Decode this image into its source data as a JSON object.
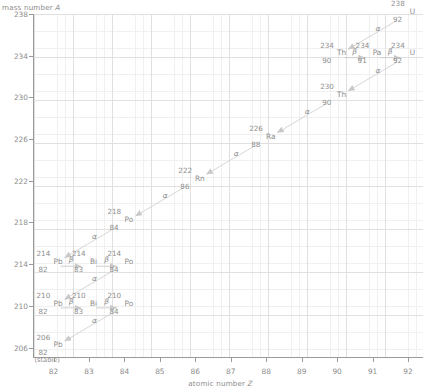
{
  "axes": {
    "y_title_text": "mass number ",
    "y_title_var": "A",
    "x_title_text": "atomic number ",
    "x_title_var": "Z",
    "y_ticks": [
      238,
      234,
      230,
      226,
      222,
      218,
      214,
      210,
      206
    ],
    "x_ticks": [
      82,
      83,
      84,
      85,
      86,
      87,
      88,
      89,
      90,
      91,
      92
    ],
    "y_min": 205,
    "y_max": 238,
    "x_min": 81.45,
    "x_max": 92.45,
    "grid": "minor+major",
    "axis_color": "#9a9a9a",
    "grid_color": "#e0e0e0",
    "minor_grid_color": "#f0f0f0",
    "text_color": "#8d8d8d"
  },
  "chart_data": {
    "type": "scatter",
    "title": "",
    "xlabel": "atomic number Z",
    "ylabel": "mass number A",
    "xlim": [
      81.45,
      92.45
    ],
    "ylim": [
      205,
      238
    ],
    "grid": true,
    "legend": "none",
    "series": [
      {
        "name": "uranium-238 decay chain",
        "points": [
          {
            "Z": 92,
            "A": 238,
            "symbol": "U",
            "note": ""
          },
          {
            "Z": 90,
            "A": 234,
            "symbol": "Th",
            "note": ""
          },
          {
            "Z": 91,
            "A": 234,
            "symbol": "Pa",
            "note": ""
          },
          {
            "Z": 92,
            "A": 234,
            "symbol": "U",
            "note": ""
          },
          {
            "Z": 90,
            "A": 230,
            "symbol": "Th",
            "note": ""
          },
          {
            "Z": 88,
            "A": 226,
            "symbol": "Ra",
            "note": ""
          },
          {
            "Z": 86,
            "A": 222,
            "symbol": "Rn",
            "note": ""
          },
          {
            "Z": 84,
            "A": 218,
            "symbol": "Po",
            "note": ""
          },
          {
            "Z": 82,
            "A": 214,
            "symbol": "Pb",
            "note": ""
          },
          {
            "Z": 83,
            "A": 214,
            "symbol": "Bi",
            "note": ""
          },
          {
            "Z": 84,
            "A": 214,
            "symbol": "Po",
            "note": ""
          },
          {
            "Z": 82,
            "A": 210,
            "symbol": "Pb",
            "note": ""
          },
          {
            "Z": 83,
            "A": 210,
            "symbol": "Bi",
            "note": ""
          },
          {
            "Z": 84,
            "A": 210,
            "symbol": "Po",
            "note": ""
          },
          {
            "Z": 82,
            "A": 206,
            "symbol": "Pb",
            "note": "(stable)"
          }
        ]
      }
    ],
    "transitions": [
      {
        "from": [
          92,
          238
        ],
        "to": [
          90,
          234
        ],
        "mode": "alpha"
      },
      {
        "from": [
          90,
          234
        ],
        "to": [
          91,
          234
        ],
        "mode": "beta"
      },
      {
        "from": [
          91,
          234
        ],
        "to": [
          92,
          234
        ],
        "mode": "beta"
      },
      {
        "from": [
          92,
          234
        ],
        "to": [
          90,
          230
        ],
        "mode": "alpha"
      },
      {
        "from": [
          90,
          230
        ],
        "to": [
          88,
          226
        ],
        "mode": "alpha"
      },
      {
        "from": [
          88,
          226
        ],
        "to": [
          86,
          222
        ],
        "mode": "alpha"
      },
      {
        "from": [
          86,
          222
        ],
        "to": [
          84,
          218
        ],
        "mode": "alpha"
      },
      {
        "from": [
          84,
          218
        ],
        "to": [
          82,
          214
        ],
        "mode": "alpha"
      },
      {
        "from": [
          82,
          214
        ],
        "to": [
          83,
          214
        ],
        "mode": "beta"
      },
      {
        "from": [
          83,
          214
        ],
        "to": [
          84,
          214
        ],
        "mode": "beta"
      },
      {
        "from": [
          84,
          214
        ],
        "to": [
          82,
          210
        ],
        "mode": "alpha"
      },
      {
        "from": [
          82,
          210
        ],
        "to": [
          83,
          210
        ],
        "mode": "beta"
      },
      {
        "from": [
          83,
          210
        ],
        "to": [
          84,
          210
        ],
        "mode": "beta"
      },
      {
        "from": [
          84,
          210
        ],
        "to": [
          82,
          206
        ],
        "mode": "alpha"
      }
    ]
  },
  "nuclides": [
    {
      "key": "u238",
      "a": "238",
      "sym": "U",
      "z": "92",
      "stable": ""
    },
    {
      "key": "th234",
      "a": "234",
      "sym": "Th",
      "z": "90",
      "stable": ""
    },
    {
      "key": "pa234",
      "a": "234",
      "sym": "Pa",
      "z": "91",
      "stable": ""
    },
    {
      "key": "u234",
      "a": "234",
      "sym": "U",
      "z": "92",
      "stable": ""
    },
    {
      "key": "th230",
      "a": "230",
      "sym": "Th",
      "z": "90",
      "stable": ""
    },
    {
      "key": "ra226",
      "a": "226",
      "sym": "Ra",
      "z": "88",
      "stable": ""
    },
    {
      "key": "rn222",
      "a": "222",
      "sym": "Rn",
      "z": "86",
      "stable": ""
    },
    {
      "key": "po218",
      "a": "218",
      "sym": "Po",
      "z": "84",
      "stable": ""
    },
    {
      "key": "pb214",
      "a": "214",
      "sym": "Pb",
      "z": "82",
      "stable": ""
    },
    {
      "key": "bi214",
      "a": "214",
      "sym": "Bi",
      "z": "83",
      "stable": ""
    },
    {
      "key": "po214",
      "a": "214",
      "sym": "Po",
      "z": "84",
      "stable": ""
    },
    {
      "key": "pb210",
      "a": "210",
      "sym": "Pb",
      "z": "82",
      "stable": ""
    },
    {
      "key": "bi210",
      "a": "210",
      "sym": "Bi",
      "z": "83",
      "stable": ""
    },
    {
      "key": "po210",
      "a": "210",
      "sym": "Po",
      "z": "84",
      "stable": ""
    },
    {
      "key": "pb206",
      "a": "206",
      "sym": "Pb",
      "z": "82",
      "stable": "(stable)"
    }
  ],
  "decay_glyphs": {
    "alpha": "α",
    "beta": "β"
  }
}
